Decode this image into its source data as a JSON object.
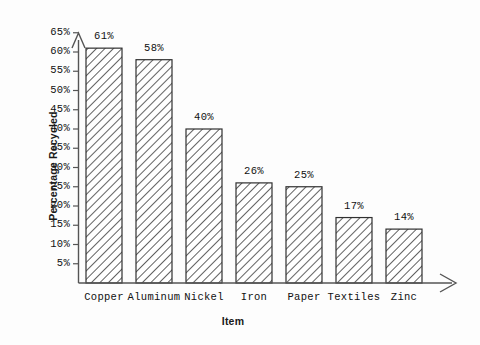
{
  "chart_data": {
    "type": "bar",
    "title": "",
    "subtitle": "",
    "xlabel": "Item",
    "ylabel": "Percentage Recycled",
    "categories": [
      "Copper",
      "Aluminum",
      "Nickel",
      "Iron",
      "Paper",
      "Textiles",
      "Zinc"
    ],
    "values": [
      61,
      58,
      40,
      26,
      25,
      17,
      14
    ],
    "value_labels": [
      "61%",
      "58%",
      "40%",
      "26%",
      "25%",
      "17%",
      "14%"
    ],
    "ylim": [
      0,
      65
    ],
    "y_ticks": [
      5,
      10,
      15,
      20,
      25,
      30,
      35,
      40,
      45,
      50,
      55,
      60,
      65
    ],
    "y_tick_labels": [
      "5%",
      "10%",
      "15%",
      "20%",
      "25%",
      "30%",
      "35%",
      "40%",
      "45%",
      "50%",
      "55%",
      "60%",
      "65%"
    ],
    "grid": false,
    "legend": null,
    "legend_position": "none",
    "bar_fill": "#ffffff",
    "bar_edge": "#303030",
    "hatch": "diagonal-forward",
    "axis_color": "#444444",
    "background": "#ffffff",
    "y_axis_arrow": true,
    "x_axis_arrow": true
  }
}
